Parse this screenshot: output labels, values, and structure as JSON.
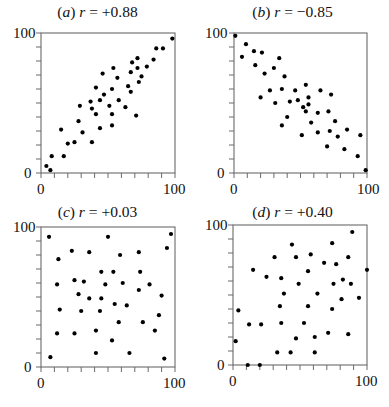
{
  "figure": {
    "panels": [
      {
        "id": "a",
        "letter": "a",
        "r_text": "+0.88"
      },
      {
        "id": "b",
        "letter": "b",
        "r_text": "−0.85"
      },
      {
        "id": "c",
        "letter": "c",
        "r_text": "+0.03"
      },
      {
        "id": "d",
        "letter": "d",
        "r_text": "+0.40"
      }
    ],
    "axis_labels": {
      "min": "0",
      "max": "100"
    },
    "r_symbol": "r",
    "equals": " = "
  },
  "chart_data": [
    {
      "type": "scatter",
      "title": "(a) r = +0.88",
      "xlim": [
        0,
        100
      ],
      "ylim": [
        0,
        100
      ],
      "xticks_labeled": [
        0,
        100
      ],
      "yticks_labeled": [
        0,
        100
      ],
      "tick_step": 10,
      "grid": false,
      "points": [
        [
          4,
          5
        ],
        [
          7,
          2
        ],
        [
          8,
          12
        ],
        [
          15,
          31
        ],
        [
          17,
          12
        ],
        [
          20,
          21
        ],
        [
          25,
          22
        ],
        [
          28,
          37
        ],
        [
          29,
          48
        ],
        [
          31,
          29
        ],
        [
          37,
          51
        ],
        [
          38,
          46
        ],
        [
          38,
          22
        ],
        [
          41,
          61
        ],
        [
          41,
          42
        ],
        [
          44,
          52
        ],
        [
          44,
          32
        ],
        [
          46,
          71
        ],
        [
          47,
          56
        ],
        [
          51,
          48
        ],
        [
          53,
          60
        ],
        [
          53,
          42
        ],
        [
          53,
          34
        ],
        [
          54,
          75
        ],
        [
          57,
          68
        ],
        [
          58,
          52
        ],
        [
          63,
          47
        ],
        [
          65,
          62
        ],
        [
          67,
          72
        ],
        [
          67,
          58
        ],
        [
          68,
          79
        ],
        [
          71,
          41
        ],
        [
          72,
          82
        ],
        [
          72,
          75
        ],
        [
          73,
          65
        ],
        [
          75,
          69
        ],
        [
          79,
          76
        ],
        [
          84,
          81
        ],
        [
          86,
          89
        ],
        [
          91,
          89
        ],
        [
          98,
          96
        ]
      ]
    },
    {
      "type": "scatter",
      "title": "(b) r = −0.85",
      "xlim": [
        0,
        100
      ],
      "ylim": [
        0,
        100
      ],
      "xticks_labeled": [
        0,
        100
      ],
      "yticks_labeled": [
        0,
        100
      ],
      "tick_step": 10,
      "grid": false,
      "points": [
        [
          1,
          98
        ],
        [
          6,
          83
        ],
        [
          9,
          92
        ],
        [
          15,
          87
        ],
        [
          16,
          77
        ],
        [
          21,
          86
        ],
        [
          23,
          71
        ],
        [
          20,
          54
        ],
        [
          27,
          59
        ],
        [
          30,
          75
        ],
        [
          31,
          50
        ],
        [
          34,
          82
        ],
        [
          36,
          60
        ],
        [
          36,
          34
        ],
        [
          38,
          69
        ],
        [
          40,
          40
        ],
        [
          42,
          51
        ],
        [
          46,
          59
        ],
        [
          48,
          52
        ],
        [
          51,
          27
        ],
        [
          52,
          47
        ],
        [
          54,
          63
        ],
        [
          54,
          44
        ],
        [
          56,
          49
        ],
        [
          56,
          54
        ],
        [
          58,
          36
        ],
        [
          63,
          43
        ],
        [
          63,
          29
        ],
        [
          65,
          59
        ],
        [
          70,
          19
        ],
        [
          71,
          44
        ],
        [
          72,
          30
        ],
        [
          73,
          56
        ],
        [
          76,
          37
        ],
        [
          78,
          26
        ],
        [
          83,
          17
        ],
        [
          85,
          31
        ],
        [
          93,
          12
        ],
        [
          95,
          27
        ],
        [
          99,
          2
        ]
      ]
    },
    {
      "type": "scatter",
      "title": "(c) r = +0.03",
      "xlim": [
        0,
        100
      ],
      "ylim": [
        0,
        100
      ],
      "xticks_labeled": [
        0,
        100
      ],
      "yticks_labeled": [
        0,
        100
      ],
      "tick_step": 10,
      "grid": false,
      "points": [
        [
          6,
          93
        ],
        [
          50,
          93
        ],
        [
          97,
          95
        ],
        [
          23,
          83
        ],
        [
          36,
          82
        ],
        [
          59,
          80
        ],
        [
          73,
          82
        ],
        [
          94,
          85
        ],
        [
          13,
          77
        ],
        [
          45,
          68
        ],
        [
          54,
          68
        ],
        [
          74,
          68
        ],
        [
          12,
          59
        ],
        [
          25,
          62
        ],
        [
          32,
          61
        ],
        [
          48,
          59
        ],
        [
          61,
          60
        ],
        [
          81,
          59
        ],
        [
          28,
          52
        ],
        [
          36,
          49
        ],
        [
          45,
          49
        ],
        [
          73,
          55
        ],
        [
          90,
          51
        ],
        [
          14,
          41
        ],
        [
          30,
          40
        ],
        [
          44,
          40
        ],
        [
          55,
          45
        ],
        [
          64,
          44
        ],
        [
          88,
          37
        ],
        [
          58,
          32
        ],
        [
          76,
          32
        ],
        [
          12,
          24
        ],
        [
          25,
          24
        ],
        [
          41,
          26
        ],
        [
          85,
          26
        ],
        [
          53,
          19
        ],
        [
          7,
          7
        ],
        [
          41,
          10
        ],
        [
          66,
          10
        ],
        [
          92,
          6
        ]
      ]
    },
    {
      "type": "scatter",
      "title": "(d) r = +0.40",
      "xlim": [
        0,
        100
      ],
      "ylim": [
        0,
        100
      ],
      "xticks_labeled": [
        0,
        100
      ],
      "yticks_labeled": [
        0,
        100
      ],
      "tick_step": 10,
      "grid": false,
      "points": [
        [
          89,
          95
        ],
        [
          44,
          86
        ],
        [
          74,
          87
        ],
        [
          31,
          77
        ],
        [
          47,
          77
        ],
        [
          58,
          79
        ],
        [
          68,
          73
        ],
        [
          77,
          72
        ],
        [
          86,
          77
        ],
        [
          15,
          68
        ],
        [
          56,
          67
        ],
        [
          100,
          68
        ],
        [
          25,
          63
        ],
        [
          36,
          62
        ],
        [
          49,
          58
        ],
        [
          75,
          58
        ],
        [
          82,
          61
        ],
        [
          88,
          58
        ],
        [
          38,
          51
        ],
        [
          63,
          51
        ],
        [
          94,
          48
        ],
        [
          81,
          47
        ],
        [
          4,
          39
        ],
        [
          35,
          42
        ],
        [
          56,
          42
        ],
        [
          74,
          40
        ],
        [
          12,
          29
        ],
        [
          21,
          29
        ],
        [
          36,
          30
        ],
        [
          53,
          30
        ],
        [
          47,
          19
        ],
        [
          61,
          20
        ],
        [
          71,
          23
        ],
        [
          86,
          22
        ],
        [
          2,
          17
        ],
        [
          33,
          9
        ],
        [
          43,
          9
        ],
        [
          61,
          9
        ],
        [
          11,
          0
        ],
        [
          20,
          0
        ]
      ]
    }
  ]
}
